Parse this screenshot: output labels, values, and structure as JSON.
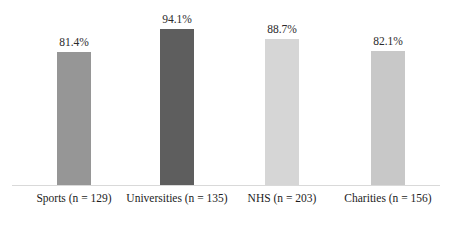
{
  "chart_data": {
    "type": "bar",
    "title": "",
    "subtitle": "",
    "xlabel": "",
    "ylabel": "",
    "ylim": [
      0,
      100
    ],
    "grid": false,
    "legend": "none",
    "axis": {
      "y_axis_visible": false,
      "x_axis_visible": true,
      "tick_labels": []
    },
    "categories": [
      "Sports (n = 129)",
      "Universities (n = 135)",
      "NHS (n = 203)",
      "Charities (n = 156)"
    ],
    "values": [
      81.4,
      94.1,
      88.7,
      82.1
    ],
    "value_labels": [
      "81.4%",
      "94.1%",
      "88.7%",
      "82.1%"
    ],
    "bar_colors": [
      "#969696",
      "#5e5e5e",
      "#d6d6d6",
      "#c8c8c8"
    ],
    "baseline_color": "#d9d9d9",
    "label_color": "#1c1c1c"
  },
  "bars": [
    {
      "category": "Sports (n = 129)",
      "value_label": "81.4%",
      "value": 81.4,
      "color": "#969696",
      "left": 57,
      "height": 133,
      "label_left": 12,
      "label_width": 124
    },
    {
      "category": "Universities (n = 135)",
      "value_label": "94.1%",
      "value": 94.1,
      "color": "#5e5e5e",
      "left": 160,
      "height": 156,
      "label_left": 120,
      "label_width": 114
    },
    {
      "category": "NHS (n = 203)",
      "value_label": "88.7%",
      "value": 88.7,
      "color": "#d6d6d6",
      "left": 265,
      "height": 146,
      "label_left": 222,
      "label_width": 120
    },
    {
      "category": "Charities (n = 156)",
      "value_label": "82.1%",
      "value": 82.1,
      "color": "#c8c8c8",
      "left": 371,
      "height": 134,
      "label_left": 330,
      "label_width": 116
    }
  ]
}
